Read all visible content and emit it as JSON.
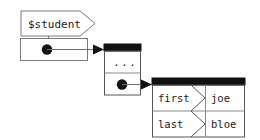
{
  "diagram": {
    "colors": {
      "background": "#ffffff",
      "outline": "#7a7a7a",
      "header_bar": "#111111",
      "dot": "#111111",
      "link": "#6f6f6f",
      "text": "#1a1a1a"
    },
    "variable": {
      "name": "variable-pentagon",
      "label": "$student",
      "shape": "pentagon-right"
    },
    "scalar_box": {
      "name": "scalar-container",
      "contains": "reference-dot",
      "points_to": "array-container"
    },
    "array_container": {
      "name": "array-container",
      "header": "",
      "rows": [
        {
          "label": "...",
          "kind": "ellipsis"
        },
        {
          "label": "",
          "kind": "reference-dot"
        }
      ],
      "points_to": "hash-container"
    },
    "hash_container": {
      "name": "hash-container",
      "header": "",
      "rows": [
        {
          "key": "first",
          "value": "joe"
        },
        {
          "key": "last",
          "value": "bloe"
        }
      ]
    },
    "arrows": [
      {
        "name": "arrow-scalar-to-array",
        "from": "scalar-container",
        "to": "array-container"
      },
      {
        "name": "arrow-array-to-hash",
        "from": "array-container",
        "to": "hash-container"
      }
    ]
  }
}
